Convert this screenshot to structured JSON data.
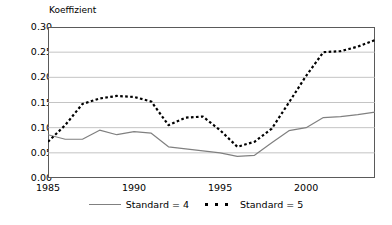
{
  "chart_data": {
    "type": "line",
    "title": "",
    "subtitle": "",
    "xlabel": "",
    "ylabel": "Koeffizient",
    "xlim": [
      1985,
      2004
    ],
    "ylim": [
      0.0,
      0.3
    ],
    "grid": true,
    "grid_axis": "y",
    "legend_position": "bottom",
    "ytick_labels": [
      "0.30",
      "0.25",
      "0.20",
      "0.15",
      "0.10",
      "0.05",
      "0.00"
    ],
    "ytick_values": [
      0.3,
      0.25,
      0.2,
      0.15,
      0.1,
      0.05,
      0.0
    ],
    "xtick_labels": [
      "1985",
      "1990",
      "1995",
      "2000"
    ],
    "xtick_values": [
      1985,
      1990,
      1995,
      2000
    ],
    "x": [
      1985,
      1986,
      1987,
      1988,
      1989,
      1990,
      1991,
      1992,
      1993,
      1994,
      1995,
      1996,
      1997,
      1998,
      1999,
      2000,
      2001,
      2002,
      2003,
      2004
    ],
    "series": [
      {
        "name": "Standard = 4",
        "style": "solid",
        "color": "#808080",
        "values": [
          0.086,
          0.077,
          0.077,
          0.095,
          0.086,
          0.092,
          0.089,
          0.062,
          0.058,
          0.054,
          0.05,
          0.043,
          0.045,
          0.07,
          0.094,
          0.1,
          0.12,
          0.122,
          0.126,
          0.131
        ]
      },
      {
        "name": "Standard = 5",
        "style": "dotted",
        "color": "#000000",
        "values": [
          0.072,
          0.105,
          0.147,
          0.158,
          0.163,
          0.161,
          0.152,
          0.105,
          0.12,
          0.122,
          0.095,
          0.062,
          0.072,
          0.098,
          0.15,
          0.203,
          0.25,
          0.252,
          0.261,
          0.274
        ]
      }
    ]
  },
  "axis": {
    "y_title": "Koeffizient"
  },
  "legend": {
    "entries": [
      {
        "label": "Standard = 4"
      },
      {
        "label": "Standard = 5"
      }
    ]
  }
}
